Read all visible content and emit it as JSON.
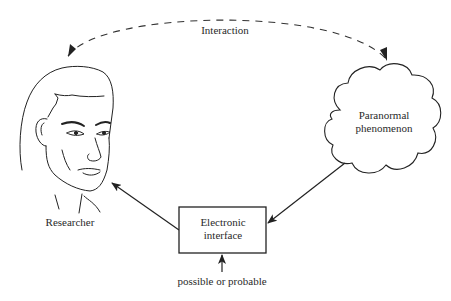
{
  "diagram": {
    "nodes": {
      "researcher": {
        "label": "Researcher",
        "shape": "face-drawing"
      },
      "phenomenon": {
        "label_line1": "Paranormal",
        "label_line2": "phenomenon",
        "shape": "cloud"
      },
      "interface": {
        "label_line1": "Electronic",
        "label_line2": "interface",
        "shape": "rectangle"
      }
    },
    "edges": [
      {
        "from": "researcher",
        "to": "phenomenon",
        "style": "dashed",
        "direction": "bidirectional",
        "label": "Interaction"
      },
      {
        "from": "interface",
        "to": "researcher",
        "style": "solid",
        "direction": "forward"
      },
      {
        "from": "phenomenon",
        "to": "interface",
        "style": "solid",
        "direction": "forward"
      },
      {
        "from": "external",
        "to": "interface",
        "style": "solid",
        "direction": "forward",
        "label": "possible or probable"
      }
    ],
    "colors": {
      "line": "#222222",
      "background": "#ffffff"
    }
  }
}
